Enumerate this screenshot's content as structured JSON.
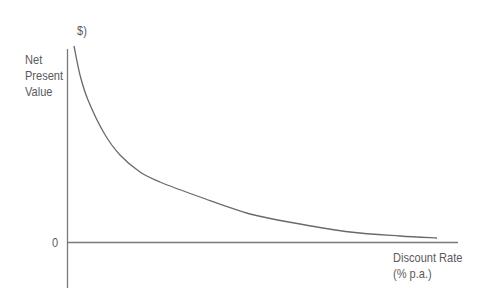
{
  "chart_data": {
    "type": "line",
    "title": "",
    "ylabel_unit": "$)",
    "ylabel_lines": [
      "Net",
      "Present",
      "Value"
    ],
    "xlabel_lines": [
      "Discount Rate",
      "(% p.a.)"
    ],
    "y_tick_labels": [
      "0"
    ],
    "grid": false,
    "legend": null,
    "series": [
      {
        "name": "NPV profile",
        "description": "Net Present Value decreases convexly as discount rate increases, approaching zero asymptotically",
        "points_px": [
          [
            74,
            46
          ],
          [
            80,
            75
          ],
          [
            88,
            100
          ],
          [
            104,
            133
          ],
          [
            120,
            155
          ],
          [
            140,
            172
          ],
          [
            160,
            182
          ],
          [
            200,
            197
          ],
          [
            250,
            214
          ],
          [
            300,
            224
          ],
          [
            350,
            232
          ],
          [
            400,
            236
          ],
          [
            437,
            238
          ]
        ]
      }
    ],
    "colors": {
      "axis": "#777777",
      "curve": "#666666",
      "text": "#5a5a5a"
    }
  },
  "labels": {
    "y_unit": "$)",
    "y_line1": "Net",
    "y_line2": "Present",
    "y_line3": "Value",
    "zero": "0",
    "x_line1": "Discount Rate",
    "x_line2": "(% p.a.)"
  }
}
